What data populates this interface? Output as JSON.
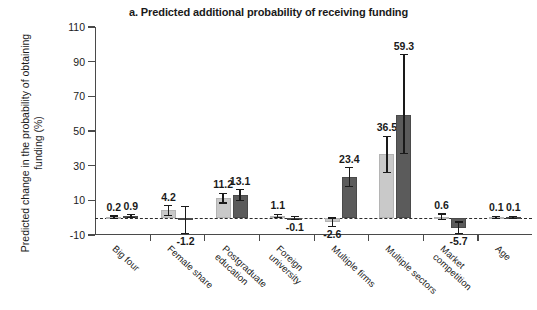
{
  "chart_data": {
    "type": "bar",
    "title": "a. Predicted additional probability of receiving funding",
    "xlabel": "",
    "ylabel": "Predicted change in the probability\nof obtaining funding (%)",
    "ylabel_line1": "Predicted change in the probability",
    "ylabel_line2": "of obtaining funding (%)",
    "ylim": [
      -10,
      110
    ],
    "yticks": [
      -10,
      10,
      30,
      50,
      70,
      90,
      110
    ],
    "ytick_labels": [
      "-10",
      "10",
      "30",
      "50",
      "70",
      "90",
      "110"
    ],
    "grid": false,
    "legend": "none",
    "zero_line": 0,
    "categories": [
      "Big four",
      "Female share",
      "Postgraduate education",
      "Foreign university",
      "Multiple firms",
      "Multiple sectors",
      "Market competition",
      "Age"
    ],
    "category_lines": [
      [
        "Big four"
      ],
      [
        "Female share"
      ],
      [
        "Postgraduate",
        "education"
      ],
      [
        "Foreign",
        "university"
      ],
      [
        "Multiple firms"
      ],
      [
        "Multiple sectors"
      ],
      [
        "Market",
        "competition"
      ],
      [
        "Age"
      ]
    ],
    "series": [
      {
        "name": "series-light",
        "color": "#c9c9c9",
        "values": [
          0.2,
          4.2,
          11.2,
          1.1,
          -2.6,
          36.5,
          0.6,
          0.1
        ],
        "labels": [
          "0.2",
          "4.2",
          "11.2",
          "1.1",
          "-2.6",
          "36.5",
          "0.6",
          "0.1"
        ],
        "err_low": [
          -0.6,
          1.4,
          8.4,
          0.2,
          -5.0,
          26.0,
          -1.0,
          -0.6
        ],
        "err_high": [
          1.0,
          7.0,
          14.0,
          2.0,
          -0.2,
          47.0,
          2.2,
          0.8
        ]
      },
      {
        "name": "series-dark",
        "color": "#5b5b5b",
        "values": [
          0.9,
          -1.2,
          13.1,
          -0.1,
          23.4,
          59.3,
          -5.7,
          0.1
        ],
        "labels": [
          "0.9",
          "-1.2",
          "13.1",
          "-0.1",
          "23.4",
          "59.3",
          "-5.7",
          "0.1"
        ],
        "err_low": [
          0.0,
          -9.0,
          10.0,
          -1.0,
          18.0,
          37.0,
          -9.0,
          -0.6
        ],
        "err_high": [
          1.8,
          6.5,
          16.2,
          0.8,
          28.8,
          94.0,
          -2.4,
          0.8
        ]
      }
    ]
  }
}
